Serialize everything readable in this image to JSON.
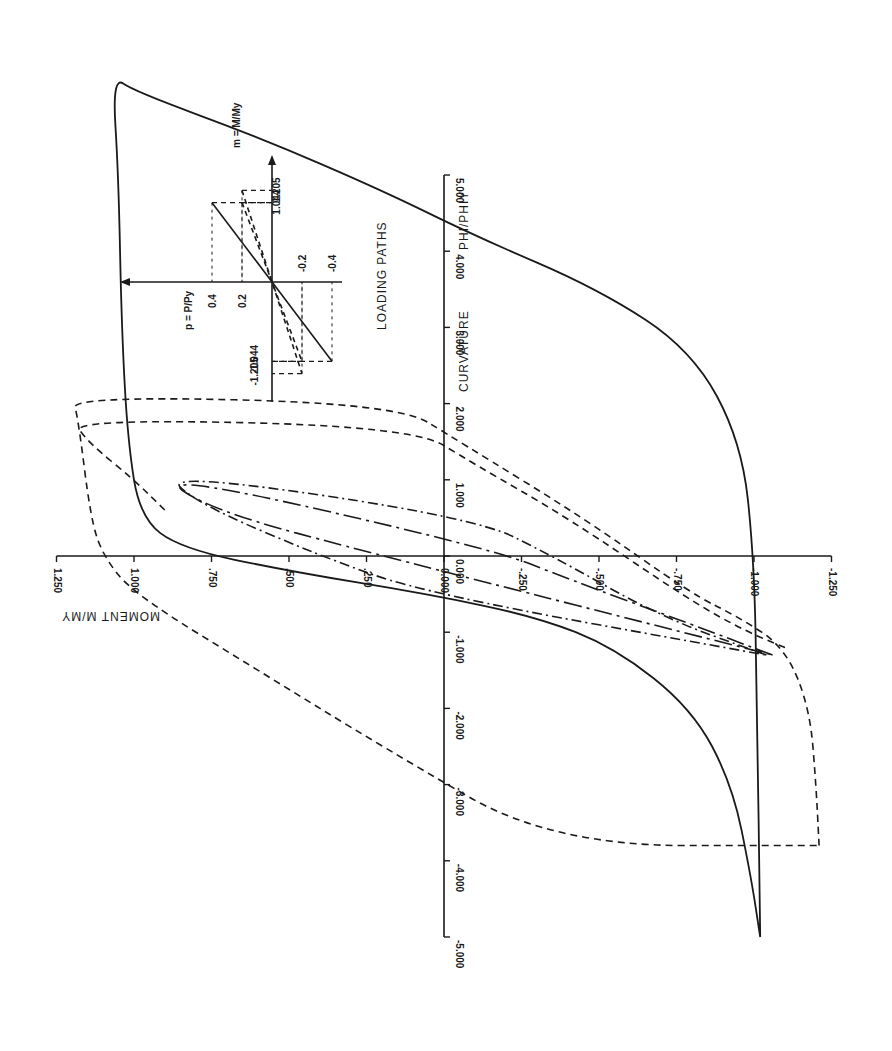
{
  "chart_data": {
    "type": "line",
    "orientation_note_visible": "figure printed rotated 90 degrees clockwise",
    "xlabel": "CURVATURE  PHI/PHIY",
    "ylabel": "MOMENT  M/MY",
    "x_ticks": [
      "-5.000",
      "-4.000",
      "-3.000",
      "-2.000",
      "-1.000",
      "0.000",
      "1.000",
      "2.000",
      "3.000",
      "4.000",
      "5.000"
    ],
    "x_tick_values": [
      -5,
      -4,
      -3,
      -2,
      -1,
      0,
      1,
      2,
      3,
      4,
      5
    ],
    "y_ticks": [
      "-1.250",
      "-1.000",
      "-.750",
      "-.500",
      "-.250",
      "0.000",
      ".250",
      ".500",
      ".750",
      "1.000",
      "1.250"
    ],
    "y_tick_values": [
      -1.25,
      -1.0,
      -0.75,
      -0.5,
      -0.25,
      0,
      0.25,
      0.5,
      0.75,
      1.0,
      1.25
    ],
    "xlim": [
      -5,
      5
    ],
    "ylim": [
      -1.25,
      1.25
    ],
    "grid": false,
    "series": [
      {
        "name": "p = 0 (solid, outer hysteresis loop)",
        "style": "solid",
        "points": [
          [
            -5.0,
            -1.02
          ],
          [
            -4.2,
            -0.99
          ],
          [
            -3.0,
            -0.93
          ],
          [
            -2.0,
            -0.8
          ],
          [
            -1.2,
            -0.55
          ],
          [
            -0.8,
            -0.3
          ],
          [
            -0.5,
            0.05
          ],
          [
            -0.2,
            0.5
          ],
          [
            0.1,
            0.85
          ],
          [
            0.5,
            0.98
          ],
          [
            1.5,
            1.02
          ],
          [
            3.0,
            1.04
          ],
          [
            5.0,
            1.05
          ],
          [
            6.3,
            1.07
          ],
          [
            6.1,
            1.0
          ],
          [
            5.5,
            0.6
          ],
          [
            4.8,
            0.2
          ],
          [
            4.2,
            -0.1
          ],
          [
            3.5,
            -0.5
          ],
          [
            2.7,
            -0.8
          ],
          [
            1.5,
            -0.96
          ],
          [
            0.0,
            -1.0
          ],
          [
            -2.0,
            -1.01
          ],
          [
            -5.0,
            -1.02
          ]
        ]
      },
      {
        "name": "p = 0.2 (dashed, cycle to M = ±1.205)",
        "style": "dashed",
        "points": [
          [
            -3.8,
            -1.21
          ],
          [
            -3.0,
            -1.2
          ],
          [
            -2.0,
            -1.18
          ],
          [
            -1.2,
            -1.1
          ],
          [
            -0.8,
            -0.95
          ],
          [
            -0.5,
            -0.8
          ],
          [
            0.5,
            -0.45
          ],
          [
            1.5,
            -0.05
          ],
          [
            2.0,
            0.15
          ],
          [
            2.1,
            1.2
          ],
          [
            1.8,
            1.18
          ],
          [
            0.5,
            1.14
          ],
          [
            0.0,
            1.1
          ],
          [
            -0.5,
            1.0
          ],
          [
            -1.5,
            0.6
          ],
          [
            -2.5,
            0.2
          ],
          [
            -3.8,
            -0.35
          ],
          [
            -3.8,
            -1.21
          ]
        ]
      },
      {
        "name": "p = 0.4 (dashed, cycle to M = ±1.044)",
        "style": "dashed",
        "points": [
          [
            -1.2,
            -1.1
          ],
          [
            -1.0,
            -0.98
          ],
          [
            -0.6,
            -0.8
          ],
          [
            0.5,
            -0.4
          ],
          [
            1.2,
            -0.1
          ],
          [
            1.7,
            0.1
          ],
          [
            1.8,
            1.2
          ],
          [
            1.5,
            1.15
          ],
          [
            1.0,
            1.0
          ],
          [
            0.6,
            0.9
          ]
        ]
      },
      {
        "name": "p = 0.2 (dash-dot, inner loop)",
        "style": "dash-dot",
        "points": [
          [
            -1.3,
            -1.04
          ],
          [
            -0.8,
            -0.7
          ],
          [
            0.0,
            -0.35
          ],
          [
            0.5,
            -0.1
          ],
          [
            1.1,
            0.9
          ],
          [
            0.7,
            0.8
          ],
          [
            0.0,
            0.4
          ],
          [
            -0.5,
            0.05
          ],
          [
            -1.3,
            -1.04
          ]
        ]
      },
      {
        "name": "p = 0.4 (long dash-dot, inner loop)",
        "style": "long-dash-dot",
        "points": [
          [
            -1.3,
            -1.06
          ],
          [
            -0.9,
            -0.8
          ],
          [
            -0.3,
            -0.4
          ],
          [
            0.1,
            -0.15
          ],
          [
            1.1,
            0.93
          ],
          [
            0.6,
            0.75
          ],
          [
            0.0,
            0.2
          ],
          [
            -1.3,
            -1.06
          ]
        ]
      }
    ],
    "inset": {
      "title": "LOADING PATHS",
      "x_axis_label": "m = M / My",
      "y_axis_label": "p = P / Py",
      "m_ticks": [
        "1.205",
        "1.044",
        "-1.044",
        "-1.205"
      ],
      "p_ticks": [
        "0.4",
        "0.2",
        "-0.2",
        "-0.4"
      ],
      "paths": [
        {
          "p": 0.4,
          "m": 1.044,
          "style": "solid"
        },
        {
          "p": 0.2,
          "m": 1.205,
          "style": "dashed"
        },
        {
          "p": 0.2,
          "m": 1.044,
          "style": "dashed"
        }
      ]
    }
  },
  "labels": {
    "x_axis_title": "CURVATURE",
    "x_axis_title_b": "PHI/PHIY",
    "y_axis_title": "MOMENT  M/MY",
    "inset_title": "LOADING PATHS",
    "inset_m": "m = M/My",
    "inset_p": "p = P/Py"
  }
}
